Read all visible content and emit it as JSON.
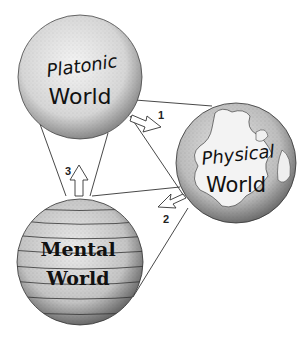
{
  "diagram": {
    "worlds": [
      {
        "id": "platonic",
        "line1": "Platonic",
        "line2": "World"
      },
      {
        "id": "physical",
        "line1": "Physical",
        "line2": "World"
      },
      {
        "id": "mental",
        "line1": "Mental",
        "line2": "World"
      }
    ],
    "arrows": [
      {
        "label": "1",
        "from": "platonic",
        "to": "physical"
      },
      {
        "label": "2",
        "from": "physical",
        "to": "mental"
      },
      {
        "label": "3",
        "from": "mental",
        "to": "platonic"
      }
    ]
  }
}
